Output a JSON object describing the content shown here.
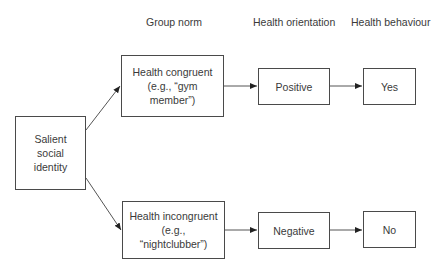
{
  "headers": {
    "group_norm": "Group norm",
    "health_orientation": "Health orientation",
    "health_behaviour": "Health behaviour"
  },
  "nodes": {
    "salient": {
      "lines": [
        "Salient",
        "social",
        "identity"
      ]
    },
    "congruent": {
      "lines": [
        "Health congruent",
        "(e.g., “gym",
        "member”)"
      ]
    },
    "incongruent": {
      "lines": [
        "Health incongruent",
        "(e.g.,",
        "“nightclubber”)"
      ]
    },
    "positive": {
      "label": "Positive"
    },
    "negative": {
      "label": "Negative"
    },
    "yes": {
      "label": "Yes"
    },
    "no": {
      "label": "No"
    }
  },
  "edges": [
    {
      "from": "salient",
      "to": "congruent"
    },
    {
      "from": "salient",
      "to": "incongruent"
    },
    {
      "from": "congruent",
      "to": "positive"
    },
    {
      "from": "positive",
      "to": "yes"
    },
    {
      "from": "incongruent",
      "to": "negative"
    },
    {
      "from": "negative",
      "to": "no"
    }
  ],
  "colors": {
    "stroke": "#4a4a4a",
    "text": "#3a3a3a",
    "background": "#ffffff"
  }
}
